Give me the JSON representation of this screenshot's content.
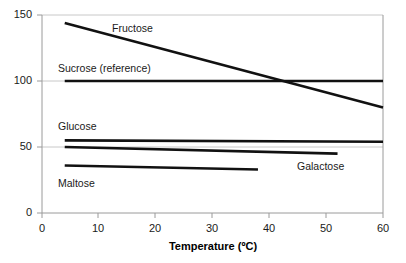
{
  "chart_data": {
    "type": "line",
    "title": "",
    "xlabel": "Temperature (ºC)",
    "ylabel": "",
    "xlim": [
      0,
      60
    ],
    "ylim": [
      0,
      150
    ],
    "xticks": [
      "0",
      "10",
      "20",
      "30",
      "40",
      "50",
      "60"
    ],
    "yticks": [
      "0",
      "50",
      "100",
      "150"
    ],
    "grid": true,
    "legend": "inline-labels",
    "line_color": "#111111",
    "grid_color": "#c8c8c8",
    "axis_color": "#9a9a9a",
    "series": [
      {
        "name": "Fructose",
        "label": "Fructose",
        "x": [
          4,
          60
        ],
        "values": [
          144,
          80
        ],
        "label_x": 112,
        "label_y": 22
      },
      {
        "name": "Sucrose (reference)",
        "label": "Sucrose (reference)",
        "x": [
          4,
          60
        ],
        "values": [
          100,
          100
        ],
        "label_x": 58,
        "label_y": 62
      },
      {
        "name": "Glucose",
        "label": "Glucose",
        "x": [
          4,
          60
        ],
        "values": [
          55,
          54
        ],
        "label_x": 58,
        "label_y": 120
      },
      {
        "name": "Galactose",
        "label": "Galactose",
        "x": [
          4,
          52
        ],
        "values": [
          50,
          45
        ],
        "label_x": 297,
        "label_y": 160
      },
      {
        "name": "Maltose",
        "label": "Maltose",
        "x": [
          4,
          38
        ],
        "values": [
          36,
          33
        ],
        "label_x": 58,
        "label_y": 177
      }
    ]
  },
  "axis": {
    "x_title": "Temperature (ºC)",
    "x_tick_0": "0",
    "x_tick_1": "10",
    "x_tick_2": "20",
    "x_tick_3": "30",
    "x_tick_4": "40",
    "x_tick_5": "50",
    "x_tick_6": "60",
    "y_tick_0": "0",
    "y_tick_1": "50",
    "y_tick_2": "100",
    "y_tick_3": "150"
  }
}
